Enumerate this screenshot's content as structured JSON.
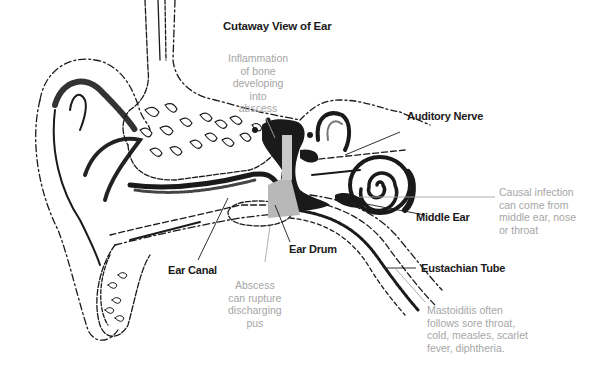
{
  "title": "Cutaway View of Ear",
  "labels": {
    "auditory_nerve": "Auditory Nerve",
    "middle_ear": "Middle Ear",
    "ear_drum": "Ear Drum",
    "ear_canal": "Ear Canal",
    "eustachian_tube": "Eustachian Tube"
  },
  "notes": {
    "inflammation": "Inflammation\nof bone\ndeveloping\ninto\nabscess",
    "causal_infection": "Causal infection\ncan come from\nmiddle ear, nose\nor throat",
    "abscess_rupture": "Abscess\ncan rupture\ndischarging\npus",
    "mastoiditis": "Mastoiditis often\nfollows sore throat,\ncold, measles, scarlet\nfever, diphtheria."
  },
  "colors": {
    "ink": "#1a1a1a",
    "note_text": "#a6a6a6",
    "highlight": "#b8b8b8",
    "background": "#ffffff"
  }
}
